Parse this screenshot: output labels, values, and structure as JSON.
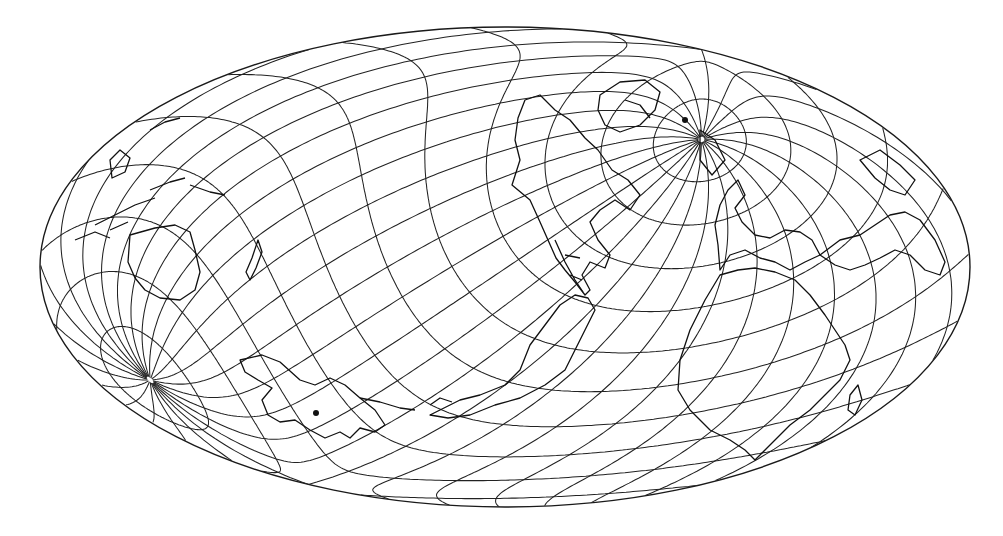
{
  "map": {
    "projection": "oblique equal-area (Hammer-type) world map",
    "style": "black line art on white",
    "colors": {
      "background": "#ffffff",
      "lines": "#1a1a1a"
    },
    "outline": {
      "cx": 505,
      "cy": 267,
      "rx": 465,
      "ry": 240
    },
    "north_pole": {
      "x": 685,
      "y": 120
    },
    "south_pole": {
      "x": 316,
      "y": 413
    },
    "graticule": {
      "meridian_step_deg": 15,
      "parallel_step_deg": 15
    },
    "features": [
      "graticule",
      "coastlines",
      "north-pole-convergence",
      "south-pole-convergence"
    ],
    "continents_visible": [
      "North America",
      "South America",
      "Europe",
      "Africa",
      "Asia",
      "Australia",
      "Antarctica",
      "Greenland",
      "New Zealand"
    ]
  }
}
